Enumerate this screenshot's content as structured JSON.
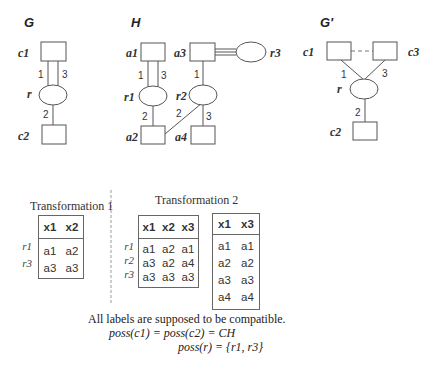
{
  "graphs": {
    "G": {
      "title": "G",
      "nodes": {
        "c1": "c1",
        "r": "r",
        "c2": "c2"
      },
      "edge_labels": [
        "1",
        "3",
        "2"
      ]
    },
    "H": {
      "title": "H",
      "nodes": {
        "a1": "a1",
        "a3": "a3",
        "r3": "r3",
        "r1": "r1",
        "r2": "r2",
        "a2": "a2",
        "a4": "a4"
      },
      "edge_labels": {
        "r1_a1_1": "1",
        "r1_a1_3": "3",
        "r1_a2": "2",
        "r2_a3": "1",
        "r2_a2": "2",
        "r2_a4": "3"
      }
    },
    "Gprime": {
      "title": "G'",
      "nodes": {
        "c1": "c1",
        "c3": "c3",
        "r": "r",
        "c2": "c2"
      },
      "edge_labels": [
        "1",
        "3",
        "2"
      ]
    }
  },
  "transformation1": {
    "caption": "Transformation 1",
    "table": {
      "headers": [
        "x1",
        "x2"
      ],
      "row_labels": [
        "r1",
        "r3"
      ],
      "rows": [
        [
          "a1",
          "a2"
        ],
        [
          "a3",
          "a3"
        ]
      ]
    }
  },
  "transformation2": {
    "caption": "Transformation 2",
    "table_left": {
      "headers": [
        "x1",
        "x2",
        "x3"
      ],
      "row_labels": [
        "r1",
        "r2",
        "r3"
      ],
      "rows": [
        [
          "a1",
          "a2",
          "a1"
        ],
        [
          "a3",
          "a2",
          "a4"
        ],
        [
          "a3",
          "a3",
          "a3"
        ]
      ]
    },
    "table_right": {
      "headers": [
        "x1",
        "x3"
      ],
      "rows": [
        [
          "a1",
          "a1"
        ],
        [
          "a2",
          "a2"
        ],
        [
          "a3",
          "a3"
        ],
        [
          "a4",
          "a4"
        ]
      ]
    }
  },
  "notes": {
    "line1": "All labels are supposed to be compatible.",
    "line2": "poss(c1) = poss(c2) = CH",
    "line3": "poss(r) = {r1, r3}"
  }
}
